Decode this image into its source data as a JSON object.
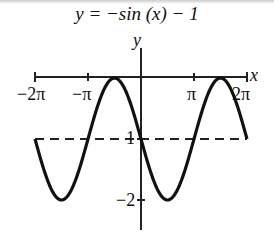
{
  "title": "y = −sin (x) − 1",
  "chart_data": {
    "type": "line",
    "title": "y = −sin (x) − 1",
    "function": "y = -sin(x) - 1",
    "xlabel": "x",
    "ylabel": "y",
    "x_range": [
      "-2π",
      "2π"
    ],
    "xlim": [
      -6.2832,
      6.2832
    ],
    "ylim": [
      -2,
      0
    ],
    "x_ticks": [
      "−2π",
      "−π",
      "π",
      "2π"
    ],
    "y_ticks": [
      "−1",
      "−2"
    ],
    "midline": {
      "y": -1,
      "style": "dashed"
    },
    "points": [
      {
        "x": "-2π",
        "y": -1
      },
      {
        "x": "-3π/2",
        "y": -2
      },
      {
        "x": "-π",
        "y": -1
      },
      {
        "x": "-π/2",
        "y": 0
      },
      {
        "x": "0",
        "y": -1
      },
      {
        "x": "π/2",
        "y": -2
      },
      {
        "x": "π",
        "y": -1
      },
      {
        "x": "3π/2",
        "y": 0
      },
      {
        "x": "2π",
        "y": -1
      }
    ],
    "grid": false
  },
  "labels": {
    "x_axis": "x",
    "y_axis": "y",
    "tick_neg2pi": "−2π",
    "tick_negpi": "−π",
    "tick_pi": "π",
    "tick_2pi": "2π",
    "tick_neg1": "1",
    "tick_neg2": "−2"
  }
}
